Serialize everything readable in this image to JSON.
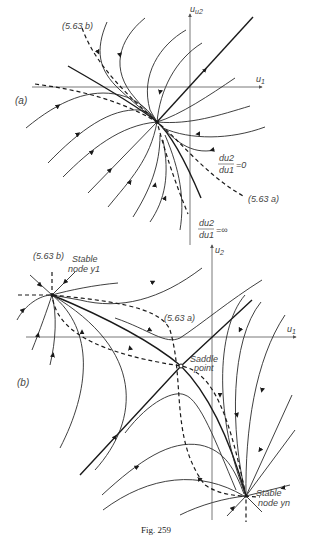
{
  "figure": {
    "caption": "Fig. 259",
    "panel_a": {
      "label": "(a)",
      "axes": {
        "x": "u1",
        "y": "u2"
      },
      "curve_labels": {
        "isocline_b": "(5.63 b)",
        "isocline_a": "(5.63 a)"
      },
      "isocline_zero": {
        "num": "du2",
        "den": "du1",
        "eq": "=0"
      },
      "isocline_inf": {
        "num": "du2",
        "den": "du1",
        "eq": "=∞"
      }
    },
    "panel_b": {
      "label": "(b)",
      "axes": {
        "x": "u1",
        "y": "u2"
      },
      "curve_labels": {
        "isocline_b": "(5.63 b)",
        "isocline_a": "(5.63 a)"
      },
      "points": {
        "node_1_line1": "Stable",
        "node_1_line2": "node  y1",
        "saddle_line1": "Saddle",
        "saddle_line2": "point",
        "node_n_line1": "Stable",
        "node_n_line2": "node  yn"
      }
    }
  }
}
